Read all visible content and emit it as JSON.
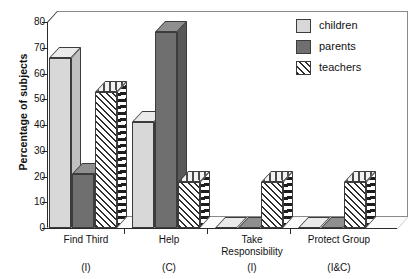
{
  "chart_data": {
    "type": "bar",
    "title": "",
    "xlabel": "",
    "ylabel": "Percentage of subjects",
    "ylim": [
      0,
      80
    ],
    "yticks": [
      0,
      10,
      20,
      30,
      40,
      50,
      60,
      70,
      80
    ],
    "grid": false,
    "legend_position": "top-right",
    "categories": [
      "Find Third",
      "Help",
      "Take Responsibility",
      "Protect Group"
    ],
    "category_sublabels": [
      "(I)",
      "(C)",
      "(I)",
      "(I&C)"
    ],
    "series": [
      {
        "name": "children",
        "color": "#d8d8d8",
        "values": [
          66,
          41,
          0,
          0
        ]
      },
      {
        "name": "parents",
        "color": "#6f6f6f",
        "values": [
          21,
          76,
          0,
          0
        ]
      },
      {
        "name": "teachers",
        "color": "#2e2e2e",
        "pattern": "diagonal-hatch",
        "values": [
          53,
          18,
          18,
          18
        ]
      }
    ]
  },
  "legend": {
    "items": [
      {
        "label": "children"
      },
      {
        "label": "parents"
      },
      {
        "label": "teachers"
      }
    ]
  },
  "axis": {
    "y_title": "Percentage of subjects",
    "tick_labels": [
      "80",
      "70",
      "60",
      "50",
      "40",
      "30",
      "20",
      "10",
      "0"
    ]
  },
  "x_axis": {
    "groups": [
      {
        "line1": "Find Third",
        "line2": "",
        "sub": "(I)"
      },
      {
        "line1": "Help",
        "line2": "",
        "sub": "(C)"
      },
      {
        "line1": "Take",
        "line2": "Responsibility",
        "sub": "(I)"
      },
      {
        "line1": "Protect Group",
        "line2": "",
        "sub": "(I&C)"
      }
    ]
  }
}
